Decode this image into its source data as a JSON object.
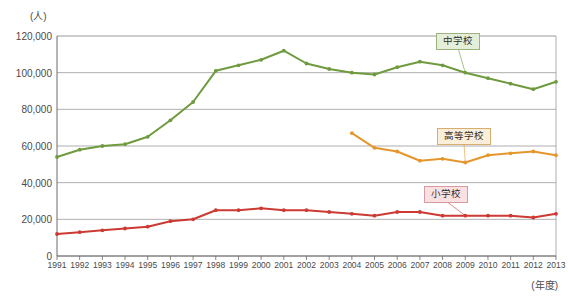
{
  "axes": {
    "y_unit": "(人)",
    "x_unit": "(年度)",
    "y_ticks": [
      "0",
      "20,000",
      "40,000",
      "60,000",
      "80,000",
      "100,000",
      "120,000"
    ]
  },
  "callouts": {
    "junior_high": "中学校",
    "high_school": "高等学校",
    "elementary": "小学校"
  },
  "colors": {
    "junior_high": "#6f9b3f",
    "high_school": "#e5962c",
    "elementary": "#cc3a33",
    "gridline": "#9a9a9a",
    "axis": "#6b6b6b",
    "text": "#4a4a4a"
  },
  "chart_data": {
    "type": "line",
    "title": "",
    "xlabel": "(年度)",
    "ylabel": "(人)",
    "ylim": [
      0,
      120000
    ],
    "ytick_step": 20000,
    "grid": true,
    "legend_position": "inline-callouts",
    "x": [
      1991,
      1992,
      1993,
      1994,
      1995,
      1996,
      1997,
      1998,
      1999,
      2000,
      2001,
      2002,
      2003,
      2004,
      2005,
      2006,
      2007,
      2008,
      2009,
      2010,
      2011,
      2012,
      2013
    ],
    "categories": [
      "1991",
      "1992",
      "1993",
      "1994",
      "1995",
      "1996",
      "1997",
      "1998",
      "1999",
      "2000",
      "2001",
      "2002",
      "2003",
      "2004",
      "2005",
      "2006",
      "2007",
      "2008",
      "2009",
      "2010",
      "2011",
      "2012",
      "2013"
    ],
    "series": [
      {
        "name": "中学校",
        "color": "#6f9b3f",
        "values": [
          54000,
          58000,
          60000,
          61000,
          65000,
          74000,
          84000,
          101000,
          104000,
          107000,
          112000,
          105000,
          102000,
          100000,
          99000,
          103000,
          106000,
          104000,
          100000,
          97000,
          94000,
          91000,
          95000
        ]
      },
      {
        "name": "高等学校",
        "color": "#e5962c",
        "values": [
          null,
          null,
          null,
          null,
          null,
          null,
          null,
          null,
          null,
          null,
          null,
          null,
          null,
          67000,
          59000,
          57000,
          52000,
          53000,
          51000,
          55000,
          56000,
          57000,
          55000
        ]
      },
      {
        "name": "小学校",
        "color": "#cc3a33",
        "values": [
          12000,
          13000,
          14000,
          15000,
          16000,
          19000,
          20000,
          25000,
          25000,
          26000,
          25000,
          25000,
          24000,
          23000,
          22000,
          24000,
          24000,
          22000,
          22000,
          22000,
          22000,
          21000,
          23000
        ]
      }
    ]
  }
}
